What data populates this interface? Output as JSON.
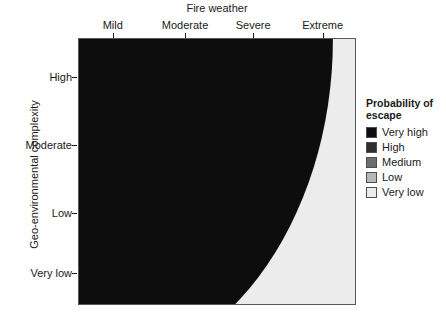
{
  "chart_data": {
    "type": "heatmap",
    "title": "",
    "xlabel": "Fire weather",
    "ylabel": "Geo-environmental complexity",
    "x_tick_labels": [
      "Mild",
      "Moderate",
      "Severe",
      "Extreme"
    ],
    "x_tick_positions": [
      0.125,
      0.385,
      0.63,
      0.88
    ],
    "y_tick_labels": [
      "High",
      "Moderate",
      "Low",
      "Very low"
    ],
    "y_tick_positions": [
      0.855,
      0.6,
      0.345,
      0.12
    ],
    "x_axis_position": "top",
    "y_axis_position": "left",
    "grid": false,
    "legend_position": "right",
    "legend_title": "Probability of escape",
    "legend_entries": [
      {
        "label": "Very high",
        "color": "#0d0d0d",
        "level": 5
      },
      {
        "label": "High",
        "color": "#2f2f2f",
        "level": 4
      },
      {
        "label": "Medium",
        "color": "#6e6e6e",
        "level": 3
      },
      {
        "label": "Low",
        "color": "#b8b8b8",
        "level": 2
      },
      {
        "label": "Very low",
        "color": "#ececec",
        "level": 1
      }
    ],
    "band_radii_fraction_of_panel_width": [
      0.33,
      0.5,
      0.7,
      0.92
    ],
    "panel_background": "#ececec",
    "panel_border_color": "#58595b"
  },
  "axes": {
    "x": {
      "title": "Fire weather",
      "ticks": [
        {
          "label": "Mild",
          "pos": 0.125
        },
        {
          "label": "Moderate",
          "pos": 0.385
        },
        {
          "label": "Severe",
          "pos": 0.63
        },
        {
          "label": "Extreme",
          "pos": 0.88
        }
      ]
    },
    "y": {
      "title": "Geo-environmental complexity",
      "ticks": [
        {
          "label": "High",
          "pos": 0.855
        },
        {
          "label": "Moderate",
          "pos": 0.6
        },
        {
          "label": "Low",
          "pos": 0.345
        },
        {
          "label": "Very low",
          "pos": 0.12
        }
      ]
    }
  },
  "legend": {
    "title": "Probability of escape",
    "items": [
      {
        "label": "Very high",
        "color": "#0d0d0d"
      },
      {
        "label": "High",
        "color": "#2f2f2f"
      },
      {
        "label": "Medium",
        "color": "#6e6e6e"
      },
      {
        "label": "Low",
        "color": "#b8b8b8"
      },
      {
        "label": "Very low",
        "color": "#ececec"
      }
    ]
  }
}
